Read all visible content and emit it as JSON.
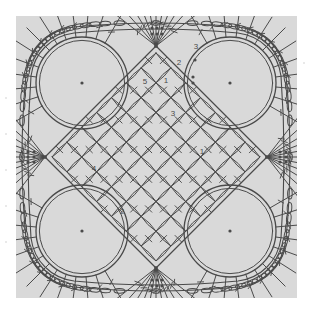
{
  "page": {
    "background_color": "#ffffff",
    "panel_color": "#d9d9d9",
    "ink_color": "#4a4a4a",
    "width": 317,
    "height": 317
  },
  "diagram": {
    "type": "crochet-stitch-diagram",
    "panel": {
      "x": 16,
      "y": 16,
      "width": 281,
      "height": 282
    },
    "center": {
      "x": 140,
      "y": 141
    },
    "symmetry": "4-fold rotational, mirrored",
    "round_labels": [
      {
        "id": "label-1-right",
        "text": "1",
        "x": 202,
        "y": 152
      },
      {
        "id": "label-2-bottom",
        "text": "2",
        "x": 122,
        "y": 212
      },
      {
        "id": "label-3-center",
        "text": "3",
        "x": 173,
        "y": 114
      },
      {
        "id": "label-4-left",
        "text": "4",
        "x": 94,
        "y": 169
      },
      {
        "id": "label-5-top",
        "text": "5",
        "x": 145,
        "y": 82
      },
      {
        "id": "label-1-topright",
        "text": "1",
        "x": 166,
        "y": 81
      },
      {
        "id": "label-2-topright",
        "text": "2",
        "x": 179,
        "y": 63
      },
      {
        "id": "label-3-topright",
        "text": "3",
        "x": 196,
        "y": 47
      }
    ],
    "structure": {
      "inner_lattice": {
        "name": "diagonal-mesh-lattice",
        "description": "Square mesh of double-crochet bars rotated 45 degrees",
        "cells_per_side": 7,
        "cell_pitch": 21
      },
      "corner_arcs": {
        "name": "corner-arc-ring",
        "count": 4,
        "description": "Large arcs separating centre lattice from outer fans"
      },
      "edge_fans": {
        "name": "edge-fan-cluster",
        "count": 4,
        "spokes_per_fan": 11,
        "description": "Radiating stitch fans at each side midpoint"
      },
      "corner_fans": {
        "name": "corner-fan-cluster",
        "count": 4,
        "spokes_per_fan": 13,
        "description": "Radiating stitch fans filling each outer corner"
      },
      "outer_border": {
        "name": "chain-loop-scallop-border",
        "description": "Elongated oval chain stitches forming the rounded outer edge"
      }
    }
  },
  "margin_specks": [
    {
      "x": 5,
      "y": 97
    },
    {
      "x": 5,
      "y": 133
    },
    {
      "x": 5,
      "y": 169
    },
    {
      "x": 5,
      "y": 205
    },
    {
      "x": 5,
      "y": 241
    },
    {
      "x": 303,
      "y": 62
    }
  ]
}
